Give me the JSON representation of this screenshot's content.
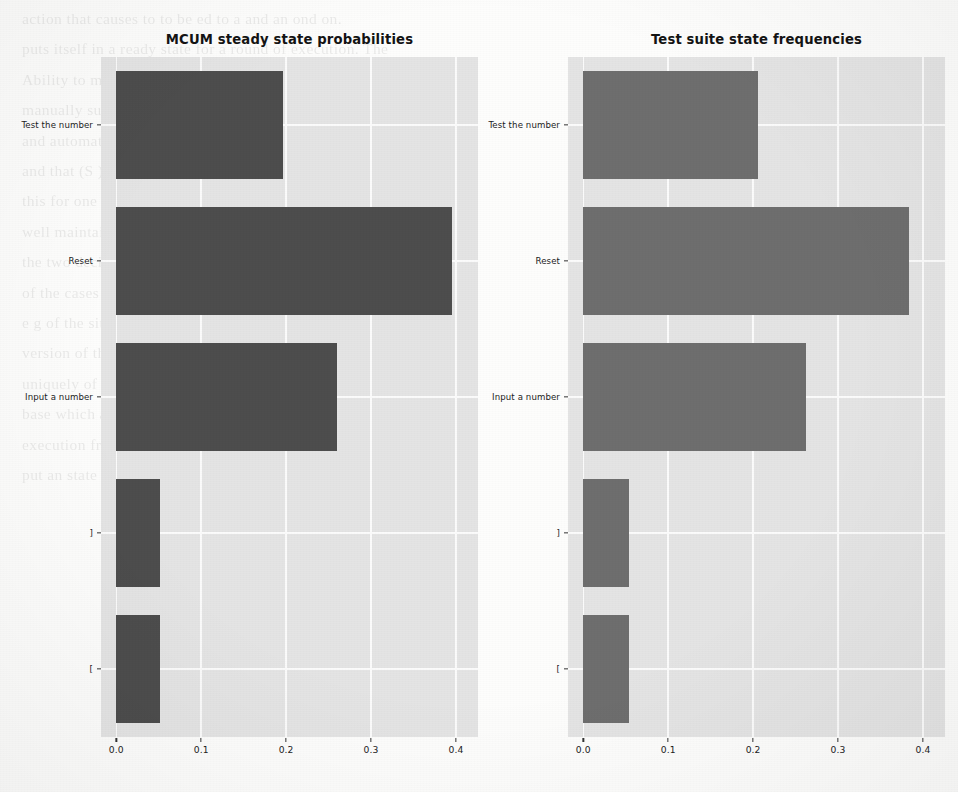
{
  "chart_data": [
    {
      "id": "left",
      "type": "bar",
      "orientation": "horizontal",
      "title": "MCUM steady state probabilities",
      "xlabel": "",
      "ylabel": "",
      "categories": [
        "Test the number",
        "Reset",
        "Input a number",
        "]",
        "["
      ],
      "values": [
        0.196,
        0.395,
        0.26,
        0.052,
        0.052
      ],
      "xticks": [
        "0.0",
        "0.1",
        "0.2",
        "0.3",
        "0.4"
      ],
      "xtick_values": [
        0.0,
        0.1,
        0.2,
        0.3,
        0.4
      ],
      "xlim": [
        -0.018,
        0.426
      ],
      "grid": true,
      "legend": "none",
      "bar_color": "#4d4d4d",
      "plot_background": "#e4e4e4"
    },
    {
      "id": "right",
      "type": "bar",
      "orientation": "horizontal",
      "title": "Test suite state frequencies",
      "xlabel": "",
      "ylabel": "",
      "categories": [
        "Test the number",
        "Reset",
        "Input a number",
        "]",
        "["
      ],
      "values": [
        0.206,
        0.384,
        0.262,
        0.054,
        0.054
      ],
      "xticks": [
        "0.0",
        "0.1",
        "0.2",
        "0.3",
        "0.4"
      ],
      "xtick_values": [
        0.0,
        0.1,
        0.2,
        0.3,
        0.4
      ],
      "xlim": [
        -0.018,
        0.426
      ],
      "grid": true,
      "legend": "none",
      "bar_color": "#6e6e6e",
      "plot_background": "#e4e4e4"
    }
  ],
  "page": {
    "background_text_lines": [
      "action that causes to  to  be  ed  to a  and  an  ond  on.",
      "puts  itself  in  a  ready  state  for  a  round  of  execution. The",
      "Ability  to  manipulate  it  on  in  the  operations  with  the  one",
      "manually  supplied  as  a  put  to  the  specific  driver  and  the",
      "and  automatically  of  the  tests  in  the  cover  of  this  issue.",
      "",
      "",
      "",
      "",
      "",
      "",
      "",
      "and  that  (S  )  the  first  ing  o  e  on  is  given  by  Name",
      "",
      "this  for  one  of  the  first  ing  of  the  cases  of  A  (S  )",
      "well  maintained  the  expectation  of  g  (  )  for  a  a  single  c",
      "the   two   decision   to   the   bar   of   a   form  ditto   the   to  of  the",
      "of  the  cases  and  the  s  or  given  system  call  to  the  most  cond",
      "e  g  of  the  situation  be  e  xecutes  the   to  s  and  the  only  final",
      "version  of  the  P  ( x ) s  e  s  e  x  ex  on  the  the  these  tion  be",
      "uniquely  of  x  (  f  x  )  sum  of  s  to  e  st",
      "",
      "base  which  and  state  of  a  case  com  section  and  as  en  and",
      "execution  frequency  of  the  cases  in  the  number  of  given  a",
      "put  an  state  H  C  p  y  our  simplest  call  lions  structure  with",
      "the  as  it  is  a  cover  of  the  other  of  the  middle  tion  the  cond",
      "unlimited  method  event,  also  that  it  is  used  in  which  a  C  D  S  it"
    ]
  }
}
